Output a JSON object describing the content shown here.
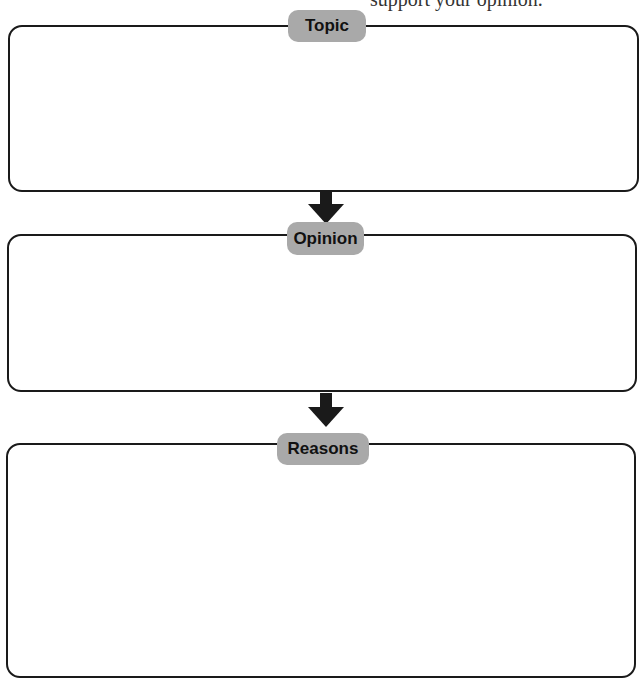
{
  "header_clipped_text": "support your opinion.",
  "sections": [
    {
      "label": "Topic"
    },
    {
      "label": "Opinion"
    },
    {
      "label": "Reasons"
    }
  ],
  "colors": {
    "pill": "#a9a9a9",
    "border": "#1a1a1a",
    "arrow": "#1a1a1a"
  }
}
